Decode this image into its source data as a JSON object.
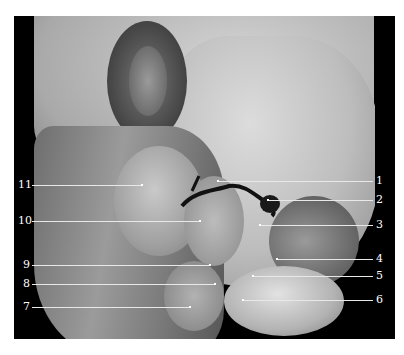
{
  "figure": {
    "background": "#000000",
    "labels_right": [
      {
        "num": "1",
        "y": 181,
        "x_from": 218
      },
      {
        "num": "2",
        "y": 200,
        "x_from": 268
      },
      {
        "num": "3",
        "y": 225,
        "x_from": 260
      },
      {
        "num": "4",
        "y": 259,
        "x_from": 277
      },
      {
        "num": "5",
        "y": 276,
        "x_from": 253
      },
      {
        "num": "6",
        "y": 300,
        "x_from": 243
      }
    ],
    "labels_left": [
      {
        "num": "11",
        "y": 185,
        "x_to": 142
      },
      {
        "num": "10",
        "y": 221,
        "x_to": 200
      },
      {
        "num": "9",
        "y": 265,
        "x_to": 210
      },
      {
        "num": "8",
        "y": 284,
        "x_to": 215
      },
      {
        "num": "7",
        "y": 307,
        "x_to": 190
      }
    ]
  }
}
